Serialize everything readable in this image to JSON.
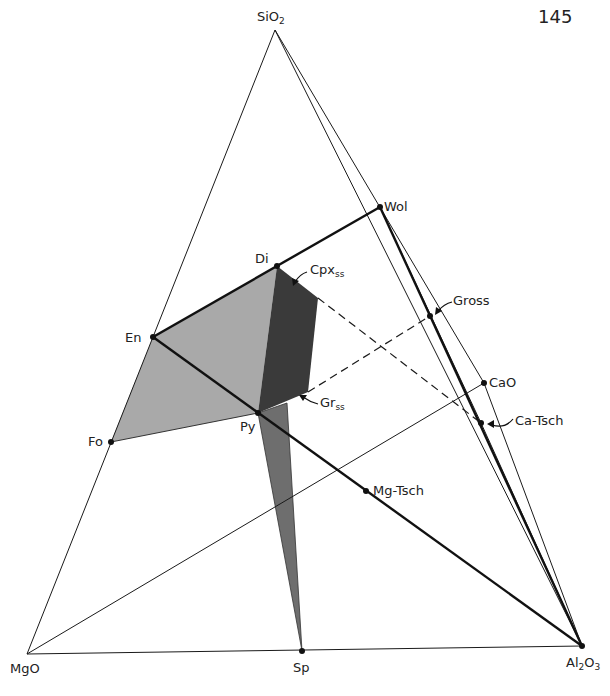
{
  "page_number": "145",
  "diagram": {
    "type": "ternary phase diagram",
    "apices": {
      "top": {
        "label": "SiO",
        "sub": "2",
        "x": 275,
        "y": 30
      },
      "bottom_left": {
        "label": "MgO",
        "sub": "",
        "x": 27,
        "y": 654
      },
      "bottom_right": {
        "label": "Al",
        "sub": "2",
        "label2": "O",
        "sub2": "3",
        "x": 582,
        "y": 646
      }
    },
    "points": [
      {
        "id": "wol",
        "label": "Wol",
        "x": 380,
        "y": 207
      },
      {
        "id": "di",
        "label": "Di",
        "x": 277,
        "y": 266
      },
      {
        "id": "en",
        "label": "En",
        "x": 153,
        "y": 337
      },
      {
        "id": "gross",
        "label": "Gross",
        "x": 430,
        "y": 316
      },
      {
        "id": "cao",
        "label": "CaO",
        "x": 484,
        "y": 383
      },
      {
        "id": "py",
        "label": "Py",
        "x": 258,
        "y": 413
      },
      {
        "id": "ca-tsch",
        "label": "Ca-Tsch",
        "x": 481,
        "y": 423
      },
      {
        "id": "fo",
        "label": "Fo",
        "x": 111,
        "y": 442
      },
      {
        "id": "mg-tsch",
        "label": "Mg-Tsch",
        "x": 366,
        "y": 491
      },
      {
        "id": "sp",
        "label": "Sp",
        "x": 302,
        "y": 651
      }
    ],
    "regions": [
      {
        "id": "cpx-ss",
        "label": "Cpx",
        "sub": "ss",
        "fill": "#3a3a3a"
      },
      {
        "id": "gr-ss",
        "label": "Gr",
        "sub": "ss",
        "fill": "#3a3a3a"
      },
      {
        "id": "fo-en-di-py",
        "fill": "#a9a9a9"
      },
      {
        "id": "py-sp-wedge",
        "fill": "#6e6e6e"
      }
    ],
    "colors": {
      "line": "#1a1a1a",
      "dark_region": "#3a3a3a",
      "light_region": "#a9a9a9",
      "mid_region": "#6e6e6e"
    }
  }
}
